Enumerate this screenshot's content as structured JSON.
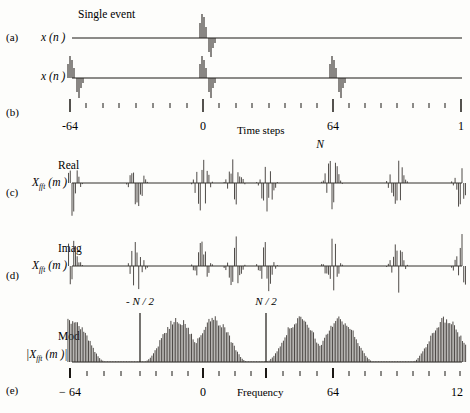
{
  "figure": {
    "title_annotation": "Single event",
    "panels": [
      {
        "tag": "(a)",
        "ylabel_main": "x",
        "ylabel_arg": "(n )",
        "type": "time-single"
      },
      {
        "tag": "(b)",
        "ylabel_main": "x",
        "ylabel_arg": "(n )",
        "type": "time-periodic"
      },
      {
        "tag": "(c)",
        "ylabel_top": "Real",
        "ylabel_main": "X",
        "ylabel_sub": "fft",
        "ylabel_arg": "(m )",
        "type": "fft-real"
      },
      {
        "tag": "(d)",
        "ylabel_top": "Imag",
        "ylabel_main": "X",
        "ylabel_sub": "fft",
        "ylabel_arg": "(m )",
        "type": "fft-imag"
      },
      {
        "tag": "(e)",
        "ylabel_top": "Mod",
        "ylabel_main": "|X",
        "ylabel_sub": "fft",
        "ylabel_arg": "(m )|",
        "type": "fft-mod"
      }
    ],
    "time_axis": {
      "label": "Time steps",
      "ticks": [
        "-64",
        "0",
        "64",
        "1"
      ],
      "n_marker": "N"
    },
    "freq_axis": {
      "label": "Frequency",
      "ticks": [
        "− 64",
        "0",
        "64",
        "12"
      ],
      "markers": [
        "- N / 2",
        "N / 2"
      ]
    }
  },
  "chart_data": {
    "type": "line",
    "title": "Single event",
    "xlabel": "Time steps",
    "ylabel": "x (n)",
    "time_axis_ticks": [
      -64,
      0,
      64,
      128
    ],
    "time_axis_tick_labels": [
      "-64",
      "0",
      "64",
      "1"
    ],
    "freq_axis_ticks": [
      -64,
      0,
      64,
      128
    ],
    "freq_axis_tick_labels": [
      "− 64",
      "0",
      "64",
      "12"
    ],
    "freq_markers": {
      "-N/2": -32,
      "N/2": 32
    },
    "panel_a": {
      "name": "Single event x(n)",
      "event_center": 0,
      "spikes": [
        {
          "x": -1.5,
          "y": 0.62
        },
        {
          "x": -0.9,
          "y": 0.95
        },
        {
          "x": -0.3,
          "y": 0.8
        },
        {
          "x": 0.4,
          "y": -0.55
        },
        {
          "x": 1.0,
          "y": -0.95
        },
        {
          "x": 1.6,
          "y": -0.42
        },
        {
          "x": 2.2,
          "y": -0.18
        }
      ]
    },
    "panel_b": {
      "name": "Periodic x(n)",
      "period": 64,
      "event_centers": [
        -64,
        0,
        64
      ],
      "spikes": [
        {
          "x": -1.5,
          "y": 0.62
        },
        {
          "x": -0.9,
          "y": 0.95
        },
        {
          "x": -0.3,
          "y": 0.8
        },
        {
          "x": 0.4,
          "y": -0.55
        },
        {
          "x": 1.0,
          "y": -0.95
        },
        {
          "x": 1.6,
          "y": -0.42
        },
        {
          "x": 2.2,
          "y": -0.18
        }
      ]
    },
    "panel_c": {
      "name": "Real part of FFT",
      "series_name": "Real X_fft(m)",
      "lobe_centers": [
        -64,
        -32,
        0,
        16,
        32,
        64,
        96,
        128
      ],
      "ylim": [
        -1,
        1
      ]
    },
    "panel_d": {
      "name": "Imaginary part of FFT",
      "series_name": "Imag X_fft(m)",
      "lobe_centers": [
        -64,
        -32,
        0,
        16,
        32,
        64,
        96,
        128
      ],
      "ylim": [
        -1,
        1
      ]
    },
    "panel_e": {
      "name": "Modulus of FFT",
      "series_name": "|X_fft(m)|",
      "lobe_centers": [
        -64,
        -12,
        6,
        48,
        68,
        120
      ],
      "ylim": [
        0,
        1
      ],
      "envelope": "raised-cosine lobes"
    }
  }
}
